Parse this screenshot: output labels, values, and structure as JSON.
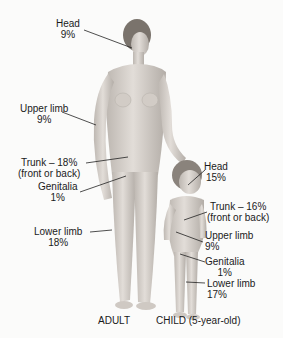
{
  "adult": {
    "caption": "ADULT",
    "labels": {
      "head": {
        "name": "Head",
        "pct": "9%"
      },
      "upper_limb": {
        "name": "Upper limb",
        "pct": "9%"
      },
      "trunk": {
        "name": "Trunk – 18%",
        "pct": "(front or back)"
      },
      "genitalia": {
        "name": "Genitalia",
        "pct": "1%"
      },
      "lower_limb": {
        "name": "Lower limb",
        "pct": "18%"
      }
    }
  },
  "child": {
    "caption": "CHILD (5-year-old)",
    "labels": {
      "head": {
        "name": "Head",
        "pct": "15%"
      },
      "trunk": {
        "name": "Trunk – 16%",
        "pct": "(front or back)"
      },
      "upper_limb": {
        "name": "Upper limb",
        "pct": "9%"
      },
      "genitalia": {
        "name": "Genitalia",
        "pct": "1%"
      },
      "lower_limb": {
        "name": "Lower limb",
        "pct": "17%"
      }
    }
  },
  "colors": {
    "skin": "#d9d4cf",
    "skin_shadow": "#b8b2ac",
    "hair": "#7a736c",
    "leader": "#222222"
  }
}
